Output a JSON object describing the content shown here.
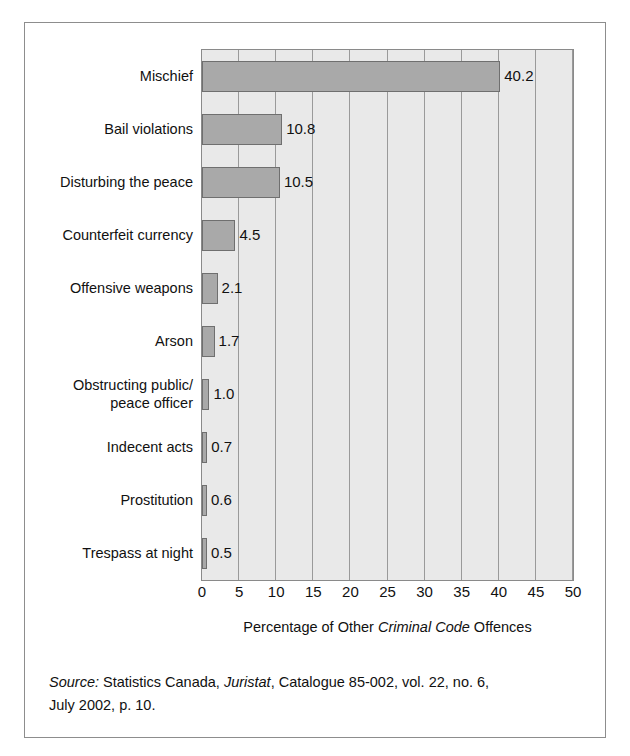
{
  "figure": {
    "source_prefix": "Source:",
    "source_text_1": " Statistics Canada, ",
    "source_italic_1": "Juristat",
    "source_text_2": ", Catalogue 85-002, vol. 22, no. 6,",
    "source_line_2": "July 2002, p. 10.",
    "axis_title_pre": "Percentage of Other ",
    "axis_title_italic": "Criminal Code",
    "axis_title_post": " Offences"
  },
  "colors": {
    "bar_fill": "#a9a9a9",
    "bar_stroke": "#6f6f6f",
    "plot_background": "#e9e9e9",
    "gridline": "#9a9a9a",
    "frame": "#8d8d8d",
    "text": "#111111"
  },
  "chart_data": {
    "type": "bar",
    "orientation": "horizontal",
    "title": "",
    "xlabel": "Percentage of Other Criminal Code Offences",
    "ylabel": "",
    "xlim": [
      0,
      50
    ],
    "xticks": [
      0,
      5,
      10,
      15,
      20,
      25,
      30,
      35,
      40,
      45,
      50
    ],
    "xtick_labels": [
      "0",
      "5",
      "10",
      "15",
      "20",
      "25",
      "30",
      "35",
      "40",
      "45",
      "50"
    ],
    "grid": "vertical",
    "legend": "none",
    "categories": [
      "Mischief",
      "Bail violations",
      "Disturbing the peace",
      "Counterfeit currency",
      "Offensive weapons",
      "Arson",
      "Obstructing public/\npeace officer",
      "Indecent acts",
      "Prostitution",
      "Trespass at night"
    ],
    "values": [
      40.2,
      10.8,
      10.5,
      4.5,
      2.1,
      1.7,
      1.0,
      0.7,
      0.6,
      0.5
    ],
    "value_labels": [
      "40.2",
      "10.8",
      "10.5",
      "4.5",
      "2.1",
      "1.7",
      "1.0",
      "0.7",
      "0.6",
      "0.5"
    ]
  }
}
